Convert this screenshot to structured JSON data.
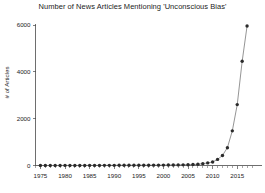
{
  "chart_data": {
    "type": "line",
    "title": "Number of News Articles Mentioning 'Unconscious Bias'",
    "xlabel": "",
    "ylabel": "# of Articles",
    "xlim": [
      1974,
      2018
    ],
    "ylim": [
      0,
      6000
    ],
    "grid": false,
    "legend": null,
    "marker": "circle",
    "xticks": [
      1975,
      1980,
      1985,
      1990,
      1995,
      2000,
      2005,
      2010,
      2015
    ],
    "xtick_labels": [
      "1975",
      "1980",
      "1985",
      "1990",
      "1995",
      "2000",
      "2005",
      "2010",
      "2015"
    ],
    "xticks_minor_step": 1,
    "yticks": [
      0,
      2000,
      4000,
      6000
    ],
    "ytick_labels": [
      "0",
      "2000",
      "4000",
      "6000"
    ],
    "x": [
      1975,
      1976,
      1977,
      1978,
      1979,
      1980,
      1981,
      1982,
      1983,
      1984,
      1985,
      1986,
      1987,
      1988,
      1989,
      1990,
      1991,
      1992,
      1993,
      1994,
      1995,
      1996,
      1997,
      1998,
      1999,
      2000,
      2001,
      2002,
      2003,
      2004,
      2005,
      2006,
      2007,
      2008,
      2009,
      2010,
      2011,
      2012,
      2013,
      2014,
      2015,
      2016,
      2017
    ],
    "values": [
      3,
      0,
      0,
      0,
      0,
      4,
      0,
      0,
      2,
      3,
      4,
      5,
      5,
      6,
      6,
      7,
      8,
      8,
      9,
      10,
      11,
      12,
      13,
      14,
      15,
      18,
      20,
      22,
      25,
      28,
      34,
      40,
      55,
      80,
      110,
      150,
      260,
      430,
      760,
      1480,
      2600,
      4450,
      5960
    ]
  },
  "colors": {
    "marker": "#2b2b2b",
    "line": "#7a7a7a",
    "axis": "#4a4a4a",
    "text": "#1c1c1c",
    "background": "#ffffff"
  }
}
